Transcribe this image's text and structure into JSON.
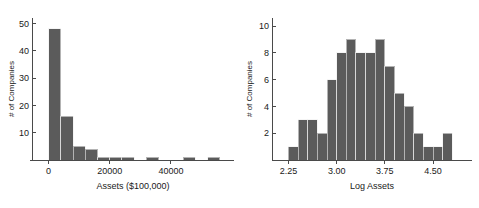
{
  "chart_data": [
    {
      "id": "assets-histogram",
      "type": "bar",
      "title": "",
      "xlabel": "Assets ($100,000)",
      "ylabel": "# of Companies",
      "xlim": [
        -2800,
        58000
      ],
      "ylim": [
        0,
        52
      ],
      "xticks": [
        0,
        20000,
        40000
      ],
      "xtick_labels": [
        "0",
        "20000",
        "40000"
      ],
      "yticks": [
        10,
        20,
        30,
        40,
        50
      ],
      "ytick_labels": [
        "10",
        "20",
        "30",
        "40",
        "50"
      ],
      "grid": false,
      "legend": "none",
      "bin_width": 4000,
      "bin_starts": [
        0,
        4000,
        8000,
        12000,
        16000,
        20000,
        24000,
        28000,
        32000,
        36000,
        40000,
        44000,
        48000,
        52000
      ],
      "values": [
        48,
        16,
        5,
        4,
        1,
        1,
        1,
        0,
        1,
        0,
        0,
        1,
        0,
        1
      ],
      "bar_color": "#5b5b5b"
    },
    {
      "id": "log-assets-histogram",
      "type": "bar",
      "title": "",
      "xlabel": "Log Assets",
      "ylabel": "# of Companies",
      "xlim": [
        2.15,
        4.95
      ],
      "ylim": [
        0,
        10.6
      ],
      "xticks": [
        2.25,
        3.0,
        3.75,
        4.5
      ],
      "xtick_labels": [
        "2.25",
        "3.00",
        "3.75",
        "4.50"
      ],
      "yticks": [
        2,
        4,
        6,
        8,
        10
      ],
      "ytick_labels": [
        "2",
        "4",
        "6",
        "8",
        "10"
      ],
      "grid": false,
      "legend": "none",
      "bin_width": 0.15,
      "bin_starts": [
        2.25,
        2.4,
        2.55,
        2.7,
        2.85,
        3.0,
        3.15,
        3.3,
        3.45,
        3.6,
        3.75,
        3.9,
        4.05,
        4.2,
        4.35,
        4.5,
        4.65
      ],
      "values": [
        1,
        3,
        3,
        2,
        6,
        8,
        9,
        8,
        8,
        9,
        7,
        5,
        4,
        2,
        1,
        1,
        2
      ],
      "bar_color": "#5b5b5b"
    }
  ],
  "figure": {
    "background": "#ffffff",
    "axis_color": "#4a4a4a",
    "text_color": "#1a1a1a"
  }
}
